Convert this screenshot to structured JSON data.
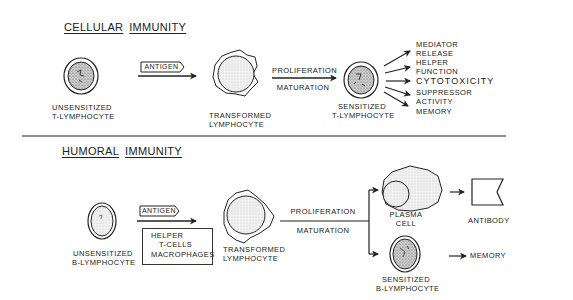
{
  "cellular": {
    "title_word1": "CELLULAR",
    "title_word2": "IMMUNITY",
    "unsensitized": {
      "line1": "UNSENSITIZED",
      "line2": "T-LYMPHOCYTE"
    },
    "antigen_label": "ANTIGEN",
    "transformed": {
      "line1": "TRANSFORMED",
      "line2": "LYMPHOCYTE"
    },
    "process_top": "PROLIFERATION",
    "process_bottom": "MATURATION",
    "sensitized": {
      "line1": "SENSITIZED",
      "line2": "T-LYMPHOCYTE"
    },
    "outcomes": [
      {
        "line1": "MEDIATOR",
        "line2": "RELEASE"
      },
      {
        "line1": "HELPER",
        "line2": "FUNCTION"
      },
      {
        "line1": "CYTOTOXICITY",
        "line2": ""
      },
      {
        "line1": "SUPPRESSOR",
        "line2": "ACTIVITY"
      },
      {
        "line1": "MEMORY",
        "line2": ""
      }
    ]
  },
  "humoral": {
    "title_word1": "HUMORAL",
    "title_word2": "IMMUNITY",
    "unsensitized": {
      "line1": "UNSENSITIZED",
      "line2": "B-LYMPHOCYTE"
    },
    "antigen_label": "ANTIGEN",
    "helper_box": {
      "line1": "HELPER",
      "line2": "T-CELLS",
      "line3": "MACROPHAGES"
    },
    "transformed": {
      "line1": "TRANSFORMED",
      "line2": "LYMPHOCYTE"
    },
    "process_top": "PROLIFERATION",
    "process_bottom": "MATURATION",
    "plasma": {
      "line1": "PLASMA",
      "line2": "CELL"
    },
    "antibody": "ANTIBODY",
    "sensitized": {
      "line1": "SENSITIZED",
      "line2": "B-LYMPHOCYTE"
    },
    "memory": "MEMORY"
  }
}
